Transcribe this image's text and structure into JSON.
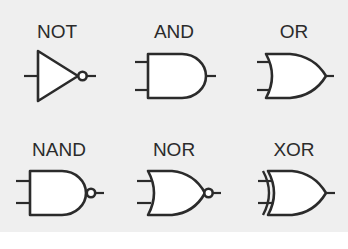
{
  "diagram": {
    "colors": {
      "background": "#efefef",
      "stroke": "#2b2b2b",
      "fill": "#ffffff"
    },
    "gates": [
      {
        "id": "not",
        "label": "NOT",
        "inputs": 1,
        "inverted_output": true
      },
      {
        "id": "and",
        "label": "AND",
        "inputs": 2,
        "inverted_output": false
      },
      {
        "id": "or",
        "label": "OR",
        "inputs": 2,
        "inverted_output": false
      },
      {
        "id": "nand",
        "label": "NAND",
        "inputs": 2,
        "inverted_output": true
      },
      {
        "id": "nor",
        "label": "NOR",
        "inputs": 2,
        "inverted_output": true
      },
      {
        "id": "xor",
        "label": "XOR",
        "inputs": 2,
        "inverted_output": false
      }
    ]
  }
}
